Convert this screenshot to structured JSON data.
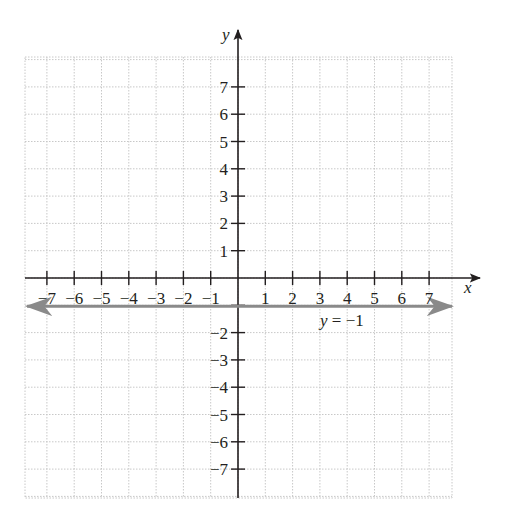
{
  "chart_data": {
    "type": "line",
    "title": "",
    "xlabel": "x",
    "ylabel": "y",
    "xlim": [
      -7.5,
      7.5
    ],
    "ylim": [
      -8,
      8
    ],
    "grid": true,
    "x_ticks": [
      -7,
      -6,
      -5,
      -4,
      -3,
      -2,
      -1,
      1,
      2,
      3,
      4,
      5,
      6,
      7
    ],
    "x_tick_labels": [
      "−7",
      "−6",
      "−5",
      "−4",
      "−3",
      "−2",
      "−1",
      "1",
      "2",
      "3",
      "4",
      "5",
      "6",
      "7"
    ],
    "y_ticks": [
      7,
      6,
      5,
      4,
      3,
      2,
      1,
      -2,
      -3,
      -4,
      -5,
      -6,
      -7
    ],
    "y_tick_labels": [
      "7",
      "6",
      "5",
      "4",
      "3",
      "2",
      "1",
      "−2",
      "−3",
      "−4",
      "−5",
      "−6",
      "−7"
    ],
    "series": [
      {
        "name": "y = −1",
        "equation": "y = -1",
        "x": [
          -7.5,
          7.5
        ],
        "y": [
          -1,
          -1
        ],
        "color": "#8a8a8a",
        "arrows": "both"
      }
    ],
    "annotations": [
      {
        "text": "y = −1",
        "x": 3.2,
        "y": -1.6
      }
    ]
  },
  "colors": {
    "axis": "#231f20",
    "grid": "#c8c8c8",
    "line": "#8a8a8a"
  }
}
